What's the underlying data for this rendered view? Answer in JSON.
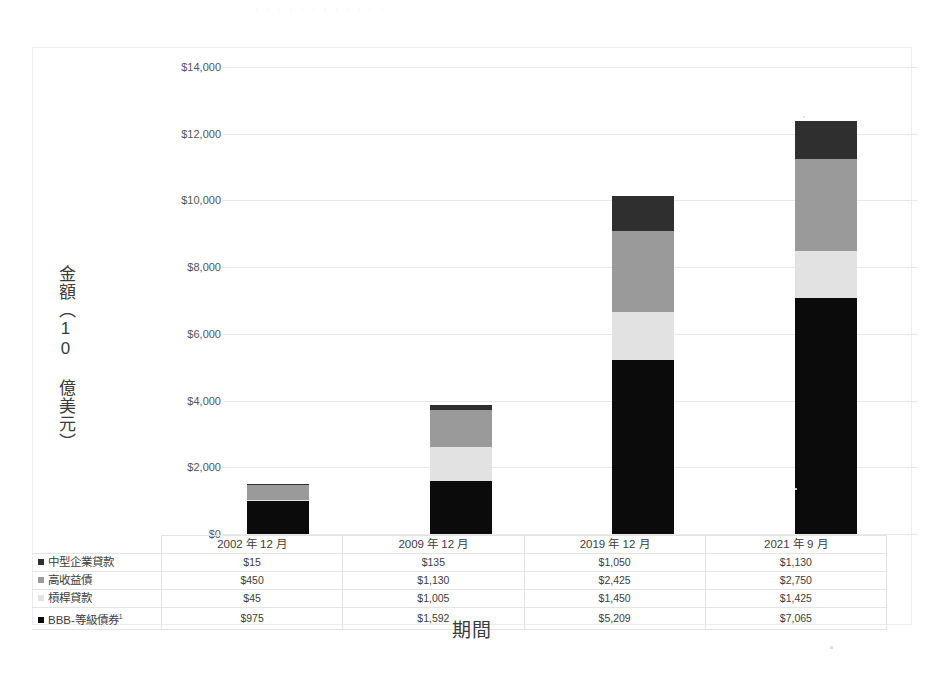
{
  "ghost_title": "· · · · · · · · · · · ·",
  "chart_data": {
    "type": "bar",
    "stacked": true,
    "title": "",
    "xlabel": "期間",
    "ylabel": "金額（10 億美元）",
    "ylim": [
      0,
      14000
    ],
    "ytick_labels": [
      "$14,000",
      "$12,000",
      "$10,000",
      "$8,000",
      "$6,000",
      "$4,000",
      "$2,000",
      "$0"
    ],
    "ytick_values": [
      14000,
      12000,
      10000,
      8000,
      6000,
      4000,
      2000,
      0
    ],
    "grid": true,
    "legend_position": "table-left",
    "categories": [
      "2002 年 12 月",
      "2009 年 12 月",
      "2019 年 12 月",
      "2021 年 9 月"
    ],
    "series": [
      {
        "name": "中型企業貸款",
        "color": "#2f2f2f",
        "stack_order": 4,
        "values": [
          15,
          135,
          1050,
          1130
        ],
        "labels": [
          "$15",
          "$135",
          "$1,050",
          "$1,130"
        ]
      },
      {
        "name": "高收益債",
        "color": "#9a9a9a",
        "stack_order": 3,
        "values": [
          450,
          1130,
          2425,
          2750
        ],
        "labels": [
          "$450",
          "$1,130",
          "$2,425",
          "$2,750"
        ]
      },
      {
        "name": "槓桿貸款",
        "color": "#e2e2e2",
        "stack_order": 2,
        "values": [
          45,
          1005,
          1450,
          1425
        ],
        "labels": [
          "$45",
          "$1,005",
          "$1,450",
          "$1,425"
        ]
      },
      {
        "name": "BBB-等級債券¹",
        "color": "#0b0b0b",
        "stack_order": 1,
        "values": [
          975,
          1592,
          5209,
          7065
        ],
        "labels": [
          "$975",
          "$1,592",
          "$5,209",
          "$7,065"
        ]
      }
    ],
    "totals": [
      1485,
      3862,
      10134,
      12370
    ]
  },
  "table": {
    "header_blank": "",
    "columns": [
      "2002 年 12 月",
      "2009 年 12 月",
      "2019 年 12 月",
      "2021 年 9 月"
    ],
    "rows": [
      {
        "label": "中型企業貸款",
        "swatch": "#2f2f2f",
        "cells": [
          "$15",
          "$135",
          "$1,050",
          "$1,130"
        ]
      },
      {
        "label": "高收益債",
        "swatch": "#9a9a9a",
        "cells": [
          "$450",
          "$1,130",
          "$2,425",
          "$2,750"
        ]
      },
      {
        "label": "槓桿貸款",
        "swatch": "#e2e2e2",
        "cells": [
          "$45",
          "$1,005",
          "$1,450",
          "$1,425"
        ]
      },
      {
        "label": "BBB-等級債券",
        "swatch": "#0b0b0b",
        "footnote": "1",
        "cells": [
          "$975",
          "$1,592",
          "$5,209",
          "$7,065"
        ]
      }
    ]
  }
}
